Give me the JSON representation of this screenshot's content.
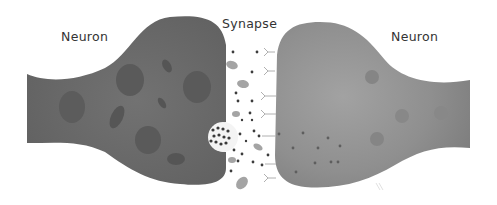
{
  "labels": {
    "left_neuron": "Neuron",
    "synapse": "Synapse",
    "right_neuron": "Neuron"
  },
  "colors": {
    "left_neuron_fill": "#6a6a6a",
    "right_neuron_fill": "#8e8e8e",
    "organelle_left": "#5a5a5a",
    "organelle_right": "#828282",
    "vesicle_fill": "#9e9e9e",
    "neurotransmitter_dot": "#3a3a3a",
    "receptor": "#b0b0b0",
    "label_text": "#333333"
  }
}
